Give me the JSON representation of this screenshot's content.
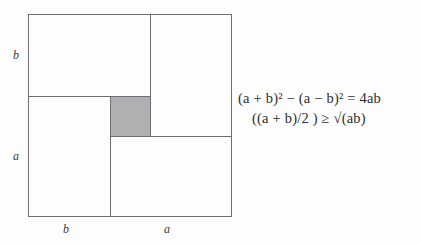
{
  "figure": {
    "type": "geometric-proof-diagram",
    "outer_square": {
      "side_parts": [
        "a",
        "b"
      ]
    },
    "shaded_square_color": "#b0b0b0",
    "line_color": "#6f6f74",
    "labels": {
      "left_top": "b",
      "left_bottom": "a",
      "bottom_left": "b",
      "bottom_right": "a"
    }
  },
  "equations": {
    "line_1": "(a + b)² − (a − b)²  =  4ab",
    "line_2": "((a + b)/2 ) ≥ √(ab)"
  }
}
